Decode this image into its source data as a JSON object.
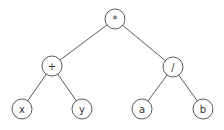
{
  "diagram": {
    "type": "expression-tree",
    "nodes": [
      {
        "id": "root",
        "label": "*",
        "x": 115,
        "y": 19
      },
      {
        "id": "plus",
        "label": "+",
        "x": 52,
        "y": 66
      },
      {
        "id": "div",
        "label": "/",
        "x": 173,
        "y": 67
      },
      {
        "id": "x",
        "label": "x",
        "x": 22,
        "y": 109
      },
      {
        "id": "y",
        "label": "y",
        "x": 82,
        "y": 109
      },
      {
        "id": "a",
        "label": "a",
        "x": 142,
        "y": 109
      },
      {
        "id": "b",
        "label": "b",
        "x": 203,
        "y": 109
      }
    ],
    "edges": [
      [
        "root",
        "plus"
      ],
      [
        "root",
        "div"
      ],
      [
        "plus",
        "x"
      ],
      [
        "plus",
        "y"
      ],
      [
        "div",
        "a"
      ],
      [
        "div",
        "b"
      ]
    ],
    "node_radius": 10,
    "colors": {
      "stroke": "#4a4a4a",
      "text": "#333333",
      "background": "#ffffff"
    }
  }
}
